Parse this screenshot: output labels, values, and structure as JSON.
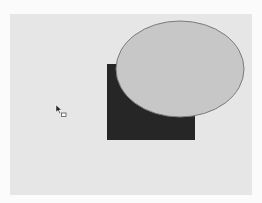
{
  "canvas": {
    "background": "#e6e6e6",
    "page_background": "#fbfbfb"
  },
  "shapes": [
    {
      "type": "rectangle",
      "name": "dark-rectangle",
      "x": 107,
      "y": 64,
      "width": 88,
      "height": 76,
      "fill": "#262626"
    },
    {
      "type": "ellipse",
      "name": "gray-ellipse",
      "cx": 180,
      "cy": 69,
      "rx": 64,
      "ry": 48,
      "fill": "#c7c7c7",
      "stroke": "#7a7a7a"
    }
  ],
  "cursor": {
    "icon": "rectangle-tool-cursor-icon",
    "x": 55,
    "y": 104
  }
}
